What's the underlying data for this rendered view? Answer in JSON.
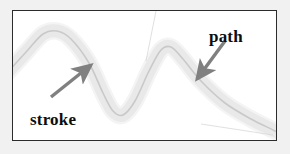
{
  "figure": {
    "background_color": "#f1f1f1",
    "frame_background": "#ffffff",
    "frame_border_color": "#2b2b2b"
  },
  "labels": {
    "stroke": "stroke",
    "path": "path"
  },
  "colors": {
    "stroke_band": "#e9e9e9",
    "stroke_band_edge": "#f4f4f4",
    "path_line": "#c9c9c9",
    "arrow": "#808080",
    "guide_line": "#d8d8d8",
    "label_text": "#0d0d0d"
  },
  "diagram": {
    "type": "stroke-and-path-illustration",
    "curve_points": [
      [
        -6,
        62
      ],
      [
        14,
        40
      ],
      [
        30,
        23
      ],
      [
        44,
        20
      ],
      [
        58,
        28
      ],
      [
        76,
        52
      ],
      [
        90,
        82
      ],
      [
        100,
        100
      ],
      [
        110,
        104
      ],
      [
        122,
        90
      ],
      [
        136,
        60
      ],
      [
        148,
        39
      ],
      [
        158,
        36
      ],
      [
        170,
        48
      ],
      [
        188,
        70
      ],
      [
        212,
        92
      ],
      [
        238,
        108
      ],
      [
        262,
        120
      ],
      [
        272,
        126
      ]
    ],
    "stroke_width": 13,
    "path_width": 1.6,
    "arrows": [
      {
        "name": "stroke-arrow",
        "from": [
          38,
          86
        ],
        "to": [
          78,
          54
        ],
        "direction": "up-right",
        "points_to": "stroke"
      },
      {
        "name": "path-arrow",
        "from": [
          212,
          30
        ],
        "to": [
          184,
          68
        ],
        "direction": "down-left",
        "points_to": "path"
      }
    ],
    "guide_lines": [
      {
        "name": "upper-guide",
        "from": [
          143,
          0
        ],
        "to": [
          133,
          50
        ]
      },
      {
        "name": "lower-guide",
        "from": [
          188,
          113
        ],
        "to": [
          260,
          124
        ]
      }
    ]
  }
}
